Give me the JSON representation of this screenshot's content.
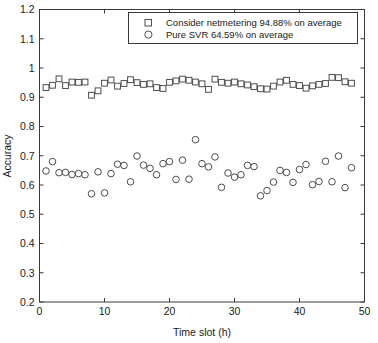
{
  "chart_data": {
    "type": "scatter",
    "title": "",
    "xlabel": "Time slot (h)",
    "ylabel": "Accuracy",
    "xlim": [
      0,
      50
    ],
    "ylim": [
      0.2,
      1.2
    ],
    "xticks": [
      0,
      10,
      20,
      30,
      40,
      50
    ],
    "yticks": [
      0.2,
      0.3,
      0.4,
      0.5,
      0.6,
      0.7,
      0.8,
      0.9,
      1,
      1.1,
      1.2
    ],
    "grid": false,
    "legend_position": "top-right-inside",
    "marker_color": "#4d4d4d",
    "axis_color": "#3a3a3a",
    "background": "#ffffff",
    "series": [
      {
        "name": "Consider netmetering 94.88% on average",
        "marker": "square",
        "x": [
          1,
          2,
          3,
          4,
          5,
          6,
          7,
          8,
          9,
          10,
          11,
          12,
          13,
          14,
          15,
          16,
          17,
          18,
          19,
          20,
          21,
          22,
          23,
          24,
          25,
          26,
          27,
          28,
          29,
          30,
          31,
          32,
          33,
          34,
          35,
          36,
          37,
          38,
          39,
          40,
          41,
          42,
          43,
          44,
          45,
          46,
          47,
          48
        ],
        "values": [
          0.933,
          0.941,
          0.963,
          0.94,
          0.952,
          0.951,
          0.952,
          0.907,
          0.922,
          0.948,
          0.959,
          0.938,
          0.947,
          0.96,
          0.95,
          0.944,
          0.946,
          0.933,
          0.93,
          0.951,
          0.956,
          0.962,
          0.958,
          0.952,
          0.946,
          0.927,
          0.962,
          0.951,
          0.948,
          0.952,
          0.946,
          0.942,
          0.936,
          0.929,
          0.928,
          0.938,
          0.952,
          0.958,
          0.944,
          0.94,
          0.931,
          0.939,
          0.944,
          0.947,
          0.968,
          0.967,
          0.953,
          0.948
        ]
      },
      {
        "name": "Pure SVR 64.59% on average",
        "marker": "circle",
        "x": [
          1,
          2,
          3,
          4,
          5,
          6,
          7,
          8,
          9,
          10,
          11,
          12,
          13,
          14,
          15,
          16,
          17,
          18,
          19,
          20,
          21,
          22,
          23,
          24,
          25,
          26,
          27,
          28,
          29,
          30,
          31,
          32,
          33,
          34,
          35,
          36,
          37,
          38,
          39,
          40,
          41,
          42,
          43,
          44,
          45,
          46,
          47,
          48
        ],
        "values": [
          0.648,
          0.68,
          0.642,
          0.643,
          0.636,
          0.639,
          0.635,
          0.57,
          0.645,
          0.573,
          0.639,
          0.671,
          0.667,
          0.611,
          0.699,
          0.668,
          0.657,
          0.635,
          0.673,
          0.68,
          0.619,
          0.685,
          0.62,
          0.755,
          0.673,
          0.662,
          0.696,
          0.592,
          0.641,
          0.627,
          0.635,
          0.667,
          0.663,
          0.563,
          0.581,
          0.61,
          0.65,
          0.643,
          0.609,
          0.653,
          0.67,
          0.601,
          0.612,
          0.681,
          0.611,
          0.699,
          0.591,
          0.659
        ]
      }
    ],
    "legend": [
      {
        "marker": "square",
        "label": "Consider netmetering 94.88% on average"
      },
      {
        "marker": "circle",
        "label": "Pure SVR 64.59% on average"
      }
    ]
  }
}
